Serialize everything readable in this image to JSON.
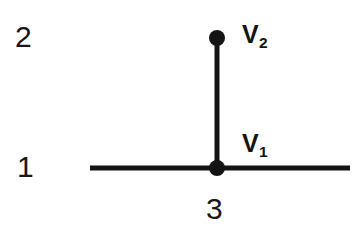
{
  "diagram": {
    "type": "node-junction-graph",
    "background_color": "#ffffff",
    "stroke_color": "#141414",
    "canvas": {
      "width": 361,
      "height": 235
    },
    "axis_labels": {
      "row_top": "2",
      "row_bottom": "1",
      "column": "3"
    },
    "nodes": [
      {
        "id": "v2",
        "label": "V",
        "subscript": "2",
        "x": 217,
        "y": 38,
        "radius": 8,
        "filled": true
      },
      {
        "id": "v1",
        "label": "V",
        "subscript": "1",
        "x": 217,
        "y": 168,
        "radius": 8,
        "filled": true
      }
    ],
    "edges": [
      {
        "id": "vertical-branch",
        "orientation": "vertical",
        "x1": 217,
        "y1": 38,
        "x2": 217,
        "y2": 168,
        "width": 5
      },
      {
        "id": "horizontal-baseline",
        "orientation": "horizontal",
        "x1": 90,
        "y1": 168,
        "x2": 350,
        "y2": 168,
        "width": 5
      }
    ]
  }
}
